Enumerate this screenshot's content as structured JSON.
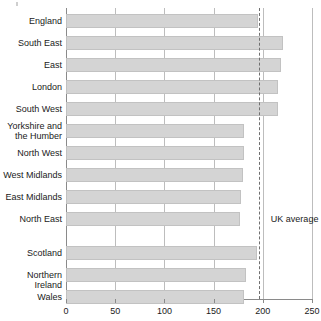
{
  "chart_data": {
    "type": "bar",
    "orientation": "horizontal",
    "title": "",
    "xlabel": "",
    "ylabel": "",
    "xlim": [
      0,
      250
    ],
    "xticks": [
      0,
      50,
      100,
      150,
      200,
      250
    ],
    "xtick_labels": [
      "0",
      "50",
      "100",
      "150",
      "200",
      "250"
    ],
    "grid": true,
    "legend": false,
    "categories": [
      "England",
      "South East",
      "East",
      "London",
      "South West",
      "Yorkshire and\nthe Humber",
      "North West",
      "West Midlands",
      "East Midlands",
      "North East",
      "Scotland",
      "Northern Ireland",
      "Wales"
    ],
    "values": [
      195,
      221,
      218,
      215,
      215,
      181,
      181,
      180,
      178,
      177,
      194,
      183,
      181
    ],
    "group_gap_after_index": 9,
    "annotations": [
      {
        "name": "uk-average",
        "label": "UK average",
        "value": 196,
        "style": "dashed-vertical-line"
      }
    ],
    "colors": {
      "bar_fill": "#d4d4d4",
      "bar_border": "#c2c2c2",
      "gridline": "#bdbdbd",
      "axis": "#8a8a8a",
      "average_line": "#6f6f6f",
      "text": "#1a1a1a",
      "background": "#ffffff"
    }
  }
}
